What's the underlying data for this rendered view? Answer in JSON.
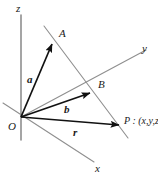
{
  "figure": {
    "type": "vector-geometry-diagram",
    "background_color": "#ffffff",
    "axis_color": "#8c8c8c",
    "line_color": "#8c8c8c",
    "vector_color": "#111111",
    "label_color": "#1a1a1a"
  },
  "axes": [
    {
      "id": "z",
      "label": "z",
      "label_x": 16,
      "label_y": 3
    },
    {
      "id": "y",
      "label": "y",
      "label_x": 142,
      "label_y": 43
    },
    {
      "id": "x",
      "label": "x",
      "label_x": 95,
      "label_y": 163
    }
  ],
  "origin": {
    "label": "O",
    "label_x": 8,
    "label_y": 121,
    "x": 21,
    "y": 117
  },
  "points": [
    {
      "id": "A",
      "label": "A",
      "label_x": 59,
      "label_y": 28,
      "x": 52,
      "y": 43
    },
    {
      "id": "B",
      "label": "B",
      "label_x": 98,
      "label_y": 79,
      "x": 90,
      "y": 92
    },
    {
      "id": "P",
      "label": "P : (x,y,z)",
      "label_x": 124,
      "label_y": 116,
      "x": 119,
      "y": 124
    }
  ],
  "vectors": [
    {
      "id": "a",
      "label": "a",
      "label_x": 27,
      "label_y": 74,
      "from": "O",
      "to": "A"
    },
    {
      "id": "b",
      "label": "b",
      "label_x": 64,
      "label_y": 104,
      "from": "O",
      "to": "B"
    },
    {
      "id": "r",
      "label": "r",
      "label_x": 73,
      "label_y": 127,
      "from": "O",
      "to": "P"
    }
  ]
}
